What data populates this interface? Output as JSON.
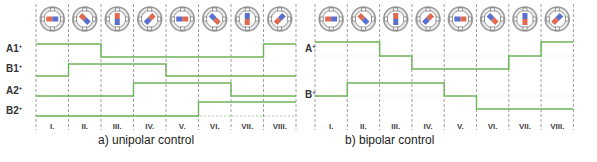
{
  "diagram": {
    "steps": [
      "I.",
      "II.",
      "III.",
      "IV.",
      "V.",
      "VI.",
      "VII.",
      "VIII."
    ],
    "colors": {
      "signal": "#6db25a",
      "divider": "#888888",
      "motor_ring": "#9a9a9a",
      "pole_red": "#e06a50",
      "pole_blue": "#5a6fd0"
    },
    "unipolar": {
      "caption": "a) unipolar control",
      "signals": [
        {
          "name": "A1",
          "levels": [
            1,
            1,
            0,
            0,
            0,
            0,
            0,
            1
          ]
        },
        {
          "name": "B1",
          "levels": [
            0,
            1,
            1,
            1,
            0,
            0,
            0,
            0
          ]
        },
        {
          "name": "A2",
          "levels": [
            0,
            0,
            0,
            1,
            1,
            1,
            0,
            0
          ]
        },
        {
          "name": "B2",
          "levels": [
            0,
            0,
            0,
            0,
            0,
            1,
            1,
            1
          ]
        }
      ]
    },
    "bipolar": {
      "caption": "b) bipolar control",
      "signals": [
        {
          "name": "A",
          "levels": [
            1,
            1,
            0,
            -1,
            -1,
            -1,
            0,
            1
          ]
        },
        {
          "name": "B",
          "levels": [
            0,
            1,
            1,
            1,
            0,
            -1,
            -1,
            -1
          ]
        }
      ]
    },
    "rotor_angles_deg": [
      0,
      45,
      90,
      135,
      180,
      225,
      270,
      315
    ]
  }
}
